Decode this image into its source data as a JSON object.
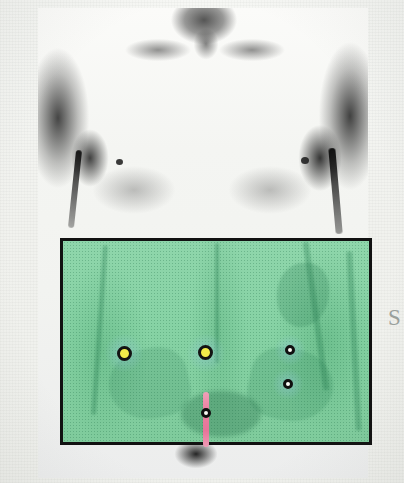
{
  "figure": {
    "caption_fragment": "S",
    "modality_note": "halftone photograph with scan field overlay"
  },
  "photo": {
    "label": "torso-photograph",
    "description": "black and white halftone photograph of a bare male chest and abdomen, anterior view",
    "background_color": "#f2f3ef",
    "ink_color": "#1a1a1a"
  },
  "scan_overlay": {
    "label": "abdominal scan field",
    "border_color": "#111111",
    "fill_color": "#86d2a4",
    "x": 60,
    "y": 238,
    "width": 312,
    "height": 207
  },
  "markers": [
    {
      "id": "marker-left-hot-spot",
      "type": "yellow-filled",
      "fill_color": "#f2ec4a",
      "ring_color": "#131313",
      "x": 124,
      "y": 353,
      "diameter": 15
    },
    {
      "id": "marker-center-hot-spot",
      "type": "yellow-filled",
      "fill_color": "#f2ec4a",
      "ring_color": "#131313",
      "x": 205,
      "y": 352,
      "diameter": 15
    },
    {
      "id": "marker-right-upper",
      "type": "ring",
      "fill_color": "#fbfbf6",
      "ring_color": "#101010",
      "x": 290,
      "y": 350,
      "diameter": 10
    },
    {
      "id": "marker-right-lower",
      "type": "ring",
      "fill_color": "#fbfbf6",
      "ring_color": "#101010",
      "x": 288,
      "y": 384,
      "diameter": 10
    },
    {
      "id": "marker-midline-lower",
      "type": "ring",
      "fill_color": "#f7f7f2",
      "ring_color": "#101010",
      "x": 206,
      "y": 413,
      "diameter": 10
    }
  ],
  "midline_marker": {
    "id": "pink-midline-line",
    "color": "#e7749a",
    "x": 206,
    "y_top": 392,
    "y_bottom": 447,
    "width": 6
  }
}
